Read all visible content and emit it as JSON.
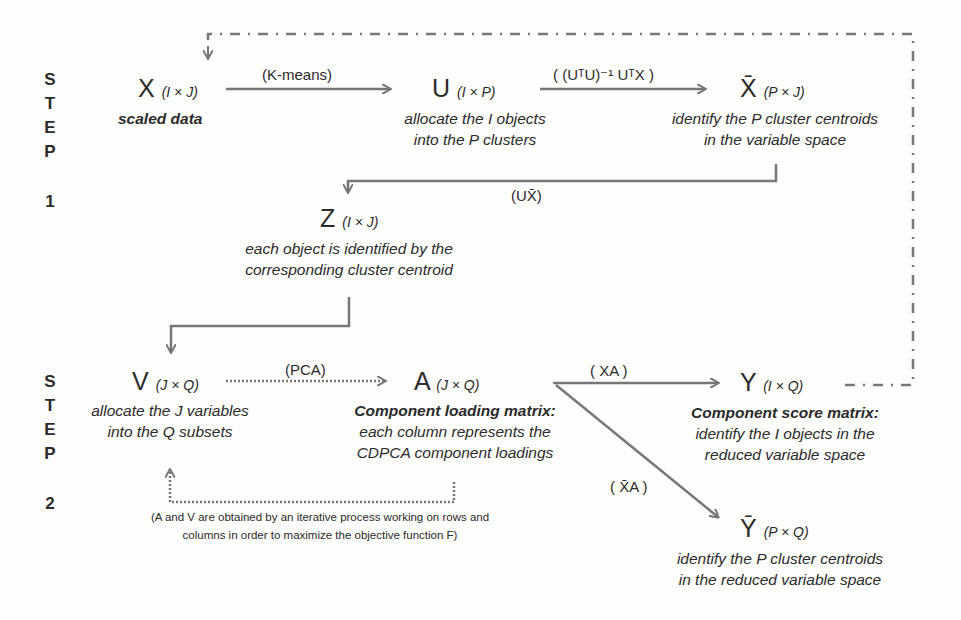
{
  "step1": {
    "letters": [
      "S",
      "T",
      "E",
      "P"
    ],
    "number": "1"
  },
  "step2": {
    "letters": [
      "S",
      "T",
      "E",
      "P"
    ],
    "number": "2"
  },
  "nodes": {
    "X": {
      "symbol": "X",
      "dim": "(I × J)",
      "desc": [
        "scaled data"
      ]
    },
    "U": {
      "symbol": "U",
      "dim": "(I × P)",
      "desc": [
        "allocate the I objects",
        "into the P clusters"
      ]
    },
    "Xbar": {
      "symbol": "X̄",
      "dim": "(P × J)",
      "desc": [
        "identify the P cluster centroids",
        "in the variable space"
      ]
    },
    "Z": {
      "symbol": "Z",
      "dim": "(I × J)",
      "desc": [
        "each object is identified by the",
        "corresponding cluster centroid"
      ]
    },
    "V": {
      "symbol": "V",
      "dim": "(J × Q)",
      "desc": [
        "allocate the J variables",
        "into the Q subsets"
      ]
    },
    "A": {
      "symbol": "A",
      "dim": "(J × Q)",
      "desc_bold": "Component loading matrix:",
      "desc": [
        "each column represents the",
        "CDPCA component loadings"
      ]
    },
    "Y": {
      "symbol": "Y",
      "dim": "(I × Q)",
      "desc_bold": "Component score matrix:",
      "desc": [
        "identify the I objects in the",
        "reduced variable space"
      ]
    },
    "Ybar": {
      "symbol": "Ȳ",
      "dim": "(P × Q)",
      "desc": [
        "identify the P cluster centroids",
        "in the reduced variable space"
      ]
    }
  },
  "operations": {
    "kmeans": "(K-means)",
    "centroid": "( (UᵀU)⁻¹ UᵀX )",
    "ux": "(UX̄)",
    "pca": "(PCA)",
    "xa": "( XA )",
    "xbara": "( X̄A )"
  },
  "note": [
    "(A and V are obtained by an iterative process working on rows and",
    "columns in order to maximize the objective  function F)"
  ],
  "colors": {
    "line": "#777777",
    "text": "#2b2b2b",
    "background": "#fdfdfb"
  }
}
